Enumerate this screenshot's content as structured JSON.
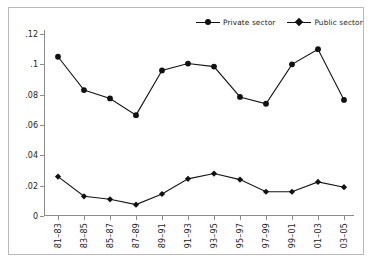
{
  "legend": {
    "entries": [
      {
        "label": "Private sector",
        "marker": "circle-icon"
      },
      {
        "label": "Public sector",
        "marker": "diamond-icon"
      }
    ]
  },
  "axes": {
    "y_ticks": [
      "0",
      ".02",
      ".04",
      ".06",
      ".08",
      ".1",
      ".12"
    ],
    "x_ticks": [
      "81–83",
      "83–85",
      "85–87",
      "87–89",
      "89–91",
      "91–93",
      "93–95",
      "95–97",
      "97–99",
      "99–01",
      "01–03",
      "03–05"
    ]
  },
  "chart_data": {
    "type": "line",
    "title": "",
    "subtitle": "",
    "xlabel": "",
    "ylabel": "",
    "grid": false,
    "legend_position": "top-right",
    "ylim": [
      0,
      0.12
    ],
    "yticks": [
      0,
      0.02,
      0.04,
      0.06,
      0.08,
      0.1,
      0.12
    ],
    "ytick_labels": [
      "0",
      ".02",
      ".04",
      ".06",
      ".08",
      ".1",
      ".12"
    ],
    "categories": [
      "81–83",
      "83–85",
      "85–87",
      "87–89",
      "89–91",
      "91–93",
      "93–95",
      "95–97",
      "97–99",
      "99–01",
      "01–03",
      "03–05"
    ],
    "series": [
      {
        "name": "Private sector",
        "marker": "circle",
        "color": "#111111",
        "values": [
          0.105,
          0.083,
          0.0775,
          0.0665,
          0.096,
          0.1005,
          0.0985,
          0.0785,
          0.074,
          0.1,
          0.11,
          0.0765
        ]
      },
      {
        "name": "Public sector",
        "marker": "diamond",
        "color": "#111111",
        "values": [
          0.026,
          0.013,
          0.011,
          0.0075,
          0.0145,
          0.0245,
          0.028,
          0.024,
          0.016,
          0.016,
          0.0225,
          0.019
        ]
      }
    ]
  }
}
